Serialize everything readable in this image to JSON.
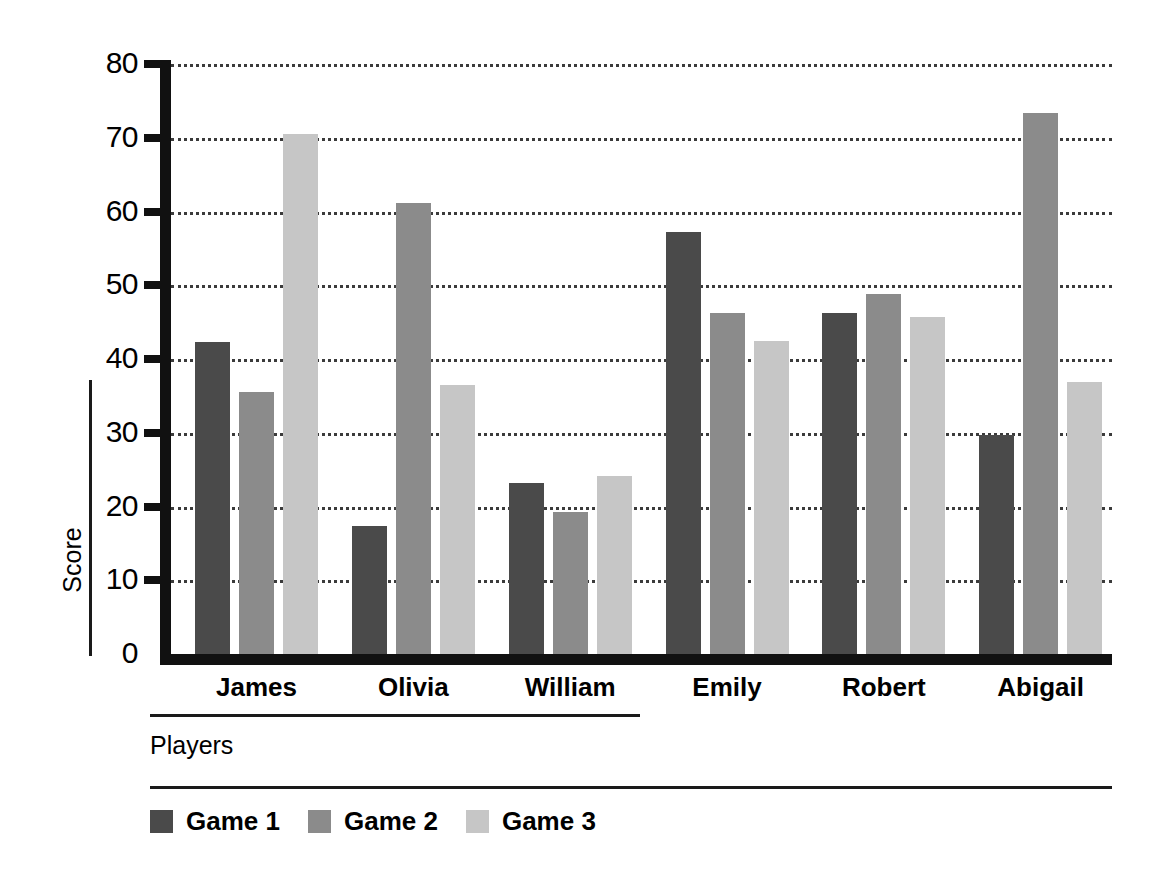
{
  "chart_data": {
    "type": "bar",
    "title": "",
    "xlabel": "Players",
    "ylabel": "Score",
    "categories": [
      "James",
      "Olivia",
      "William",
      "Emily",
      "Robert",
      "Abigail"
    ],
    "series": [
      {
        "name": "Game 1",
        "color": "#4a4a4a",
        "values": [
          42.3,
          17.3,
          23.2,
          57.2,
          46.2,
          29.7
        ]
      },
      {
        "name": "Game 2",
        "color": "#8b8b8b",
        "values": [
          35.5,
          61.2,
          19.2,
          46.3,
          48.8,
          73.3
        ]
      },
      {
        "name": "Game 3",
        "color": "#c6c6c6",
        "values": [
          70.5,
          36.5,
          24.2,
          42.4,
          45.7,
          36.9
        ]
      }
    ],
    "ylim": [
      0,
      80
    ],
    "yticks": [
      0,
      10,
      20,
      30,
      40,
      50,
      60,
      70,
      80
    ],
    "ytick_labels": [
      "0",
      "10",
      "20",
      "30",
      "40",
      "50",
      "60",
      "70",
      "80"
    ],
    "grid": true,
    "grid_style": "dotted",
    "legend_position": "bottom-left",
    "orientation": "vertical",
    "bar_group_count": 6,
    "bars_per_group": 3
  },
  "axis": {
    "y_title": "Score",
    "x_title": "Players"
  },
  "legend": {
    "entries": [
      {
        "label": "Game 1",
        "color": "#4a4a4a"
      },
      {
        "label": "Game 2",
        "color": "#8b8b8b"
      },
      {
        "label": "Game 3",
        "color": "#c6c6c6"
      }
    ]
  }
}
